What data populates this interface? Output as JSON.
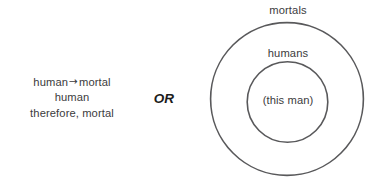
{
  "canvas": {
    "width": 386,
    "height": 188,
    "background": "#ffffff"
  },
  "colors": {
    "text": "#3b3b3d",
    "or_text": "#1c1c1c",
    "circle_stroke": "#59595b"
  },
  "syllogism": {
    "line1_antecedent": "human",
    "line1_arrow": "→",
    "line1_consequent": "mortal",
    "line2": "human",
    "line3": "therefore, mortal"
  },
  "connector": {
    "label": "OR"
  },
  "euler_diagram": {
    "outer_label": "mortals",
    "middle_label": "humans",
    "inner_label": "(this man)",
    "outer_circle": {
      "cx": 287,
      "cy": 99,
      "r": 76.5
    },
    "inner_circle": {
      "cx": 287.5,
      "cy": 102,
      "r": 40.5
    },
    "stroke_width": 1.6
  }
}
